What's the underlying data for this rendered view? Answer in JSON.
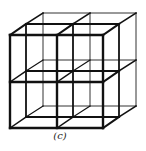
{
  "figure": {
    "caption": "(c)",
    "colors": {
      "line": "#111111",
      "back_line": "#333333",
      "background": "#ffffff"
    },
    "front": {
      "x0": 10,
      "y0": 35,
      "x1": 103,
      "y1": 128,
      "xm": 57,
      "ym": 82
    },
    "depth_offset_mid": {
      "dx": 16,
      "dy": -11
    },
    "depth_offset_back": {
      "dx": 33,
      "dy": -22
    }
  }
}
